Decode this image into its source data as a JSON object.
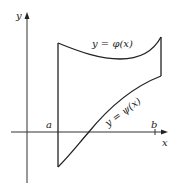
{
  "diagram": {
    "type": "region-between-curves",
    "axes": {
      "x_label": "x",
      "y_label": "y"
    },
    "bounds": {
      "left_label": "a",
      "right_label": "b"
    },
    "curves": {
      "upper": {
        "label": "y = φ(x)"
      },
      "lower": {
        "label": "y = ψ(x)"
      }
    },
    "colors": {
      "stroke": "#222222",
      "background": "#ffffff"
    }
  }
}
